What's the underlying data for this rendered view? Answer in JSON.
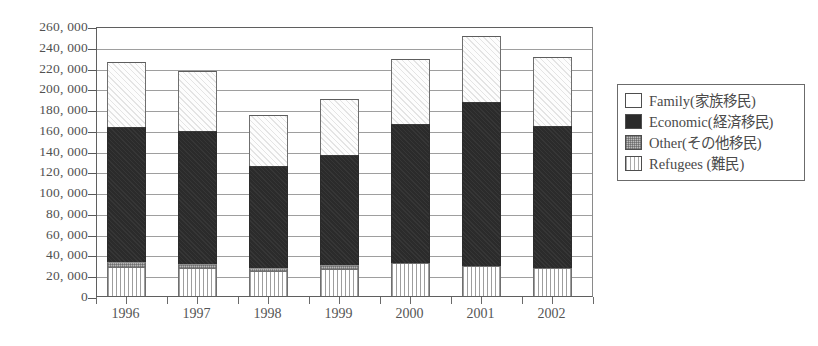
{
  "chart_data": {
    "type": "bar",
    "subtype": "stacked",
    "title": "",
    "xlabel": "",
    "ylabel": "",
    "categories": [
      "1996",
      "1997",
      "1998",
      "1999",
      "2000",
      "2001",
      "2002"
    ],
    "ylim": [
      0,
      260000
    ],
    "ytick_step": 20000,
    "ytick_labels": [
      "260, 000",
      "240, 000",
      "220, 000",
      "200, 000",
      "180, 000",
      "160, 000",
      "140, 000",
      "120, 000",
      "100, 000",
      "80, 000",
      "60, 000",
      "40, 000",
      "20, 000",
      "0"
    ],
    "ytick_values": [
      260000,
      240000,
      220000,
      200000,
      180000,
      160000,
      140000,
      120000,
      100000,
      80000,
      60000,
      40000,
      20000,
      0
    ],
    "grid": true,
    "legend_position": "right",
    "series": [
      {
        "name": "Family(家族移民)",
        "key": "family",
        "fill": "white-hatched",
        "values": [
          62000,
          58000,
          49000,
          54000,
          62000,
          63000,
          66000
        ]
      },
      {
        "name": "Economic(経済移民)",
        "key": "economic",
        "fill": "dark-solid",
        "values": [
          130000,
          128000,
          98000,
          106000,
          134000,
          158000,
          137000
        ]
      },
      {
        "name": "Other(その他移民)",
        "key": "other",
        "fill": "gray-dotted",
        "values": [
          5000,
          4000,
          3000,
          4000,
          0,
          0,
          0
        ]
      },
      {
        "name": "Refugees (難民)",
        "key": "refugees",
        "fill": "white-vertical-lines",
        "values": [
          28000,
          27000,
          24000,
          26000,
          32000,
          29000,
          27000
        ]
      }
    ],
    "totals": [
      225000,
      217000,
      174000,
      190000,
      228000,
      250000,
      230000
    ]
  },
  "legend": {
    "items": [
      {
        "label": "Family(家族移民)",
        "swatch": "family-swatch"
      },
      {
        "label": "Economic(経済移民)",
        "swatch": "economic-swatch"
      },
      {
        "label": "Other(その他移民)",
        "swatch": "other-swatch"
      },
      {
        "label": "Refugees (難民)",
        "swatch": "refugees-swatch"
      }
    ]
  }
}
